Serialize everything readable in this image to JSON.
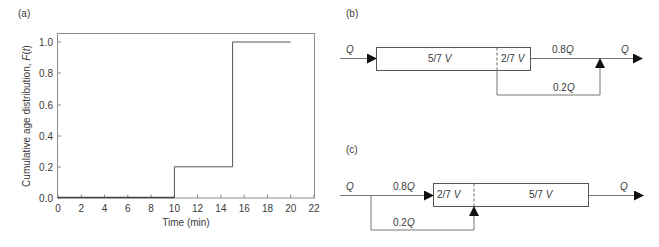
{
  "panels": {
    "a": {
      "label": "(a)",
      "ylabel_main": "Cumulative age distribution, ",
      "ylabel_func": "F",
      "ylabel_open": "(",
      "ylabel_var": "t",
      "ylabel_close": ")",
      "xlabel": "Time (min)"
    },
    "b": {
      "label": "(b)",
      "inlet_flow": "Q",
      "seg1_volume": "5/7 V",
      "seg2_volume": "2/7 V",
      "main_flow": "0.8Q",
      "bypass_flow": "0.2Q",
      "outlet_flow": "Q"
    },
    "c": {
      "label": "(c)",
      "inlet_flow": "Q",
      "main_flow": "0.8Q",
      "seg1_volume": "2/7 V",
      "seg2_volume": "5/7 V",
      "bypass_flow": "0.2Q",
      "outlet_flow": "Q"
    }
  },
  "chart_data": {
    "type": "line",
    "title": "(a)",
    "xlabel": "Time (min)",
    "ylabel": "Cumulative age distribution, F(t)",
    "xlim": [
      0,
      22
    ],
    "ylim": [
      0,
      1.05
    ],
    "xticks": [
      0,
      2,
      4,
      6,
      8,
      10,
      12,
      14,
      16,
      18,
      20,
      22
    ],
    "yticks": [
      0.0,
      0.2,
      0.4,
      0.6,
      0.8,
      1.0
    ],
    "xtick_labels": [
      "0",
      "2",
      "4",
      "6",
      "8",
      "10",
      "12",
      "14",
      "16",
      "18",
      "20",
      "22"
    ],
    "ytick_labels": [
      "0.0",
      "0.2",
      "0.4",
      "0.6",
      "0.8",
      "1.0"
    ],
    "grid": false,
    "legend": null,
    "series": [
      {
        "name": "F(t)",
        "step": true,
        "x": [
          0,
          10,
          10,
          15,
          15,
          20
        ],
        "y": [
          0,
          0,
          0.2,
          0.2,
          1.0,
          1.0
        ]
      }
    ]
  }
}
